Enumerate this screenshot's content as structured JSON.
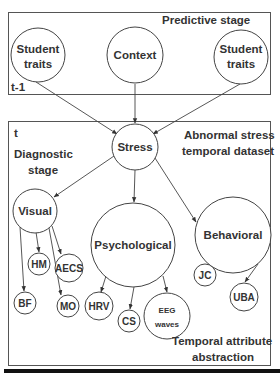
{
  "diagram": {
    "regions": {
      "predictive": {
        "label": "Predictive stage",
        "time_label": "t-1"
      },
      "diagnostic": {
        "time_label": "t",
        "stage_label_line1": "Diagnostic",
        "stage_label_line2": "stage",
        "dataset_label_line1": "Abnormal stress",
        "dataset_label_line2": "temporal dataset",
        "abstraction_label_line1": "Temporal attribute",
        "abstraction_label_line2": "abstraction"
      }
    },
    "nodes": {
      "student_traits_left": {
        "line1": "Student",
        "line2": "traits"
      },
      "context": {
        "label": "Context"
      },
      "student_traits_right": {
        "line1": "Student",
        "line2": "traits"
      },
      "stress": {
        "label": "Stress"
      },
      "visual": {
        "label": "Visual"
      },
      "psychological": {
        "label": "Psychological"
      },
      "behavioral": {
        "label": "Behavioral"
      },
      "hm": {
        "label": "HM"
      },
      "aecs": {
        "label": "AECS"
      },
      "bf": {
        "label": "BF"
      },
      "mo": {
        "label": "MO"
      },
      "hrv": {
        "label": "HRV"
      },
      "cs": {
        "label": "CS"
      },
      "eeg": {
        "line1": "EEG",
        "line2": "waves"
      },
      "jc": {
        "label": "JC"
      },
      "uba": {
        "label": "UBA"
      }
    },
    "edges": [
      [
        "Student traits (t-1)",
        "Stress"
      ],
      [
        "Context",
        "Stress"
      ],
      [
        "Student traits (t-1, right)",
        "Stress"
      ],
      [
        "Stress",
        "Visual"
      ],
      [
        "Stress",
        "Psychological"
      ],
      [
        "Stress",
        "Behavioral"
      ],
      [
        "Visual",
        "HM"
      ],
      [
        "Visual",
        "AECS"
      ],
      [
        "Visual",
        "BF"
      ],
      [
        "Visual",
        "MO"
      ],
      [
        "Psychological",
        "HRV"
      ],
      [
        "Psychological",
        "CS"
      ],
      [
        "Psychological",
        "EEG waves"
      ],
      [
        "Behavioral",
        "JC"
      ],
      [
        "Behavioral",
        "UBA"
      ]
    ]
  }
}
